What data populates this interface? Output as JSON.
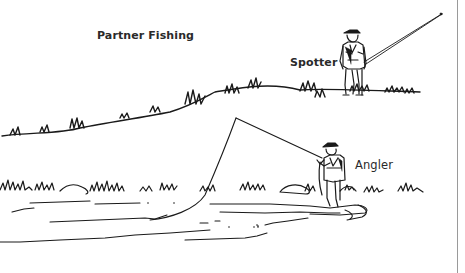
{
  "figure": {
    "title": "Partner Fishing",
    "labels": {
      "spotter": "Spotter",
      "angler": "Angler"
    },
    "elements": [
      "spotter-figure-on-bank",
      "angler-figure-wading",
      "fly-rod-spotter",
      "fly-rod-angler",
      "fly-line",
      "upper-grass-bank",
      "lower-grass-bank",
      "river-water",
      "rocks"
    ],
    "colors": {
      "ink": "#1a1a1a",
      "background": "#ffffff",
      "edge_line": "#9a9a9a"
    }
  }
}
